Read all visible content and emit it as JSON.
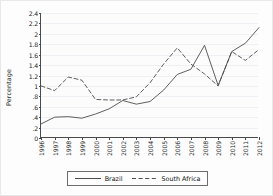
{
  "chart_data": {
    "type": "line",
    "title": "",
    "xlabel": "",
    "ylabel": "Percentage",
    "grid": true,
    "legend_position": "bottom",
    "x": [
      1996,
      1997,
      1998,
      1999,
      2000,
      2001,
      2002,
      2003,
      2004,
      2005,
      2006,
      2007,
      2008,
      2009,
      2010,
      2011,
      2012
    ],
    "xtick_labels": [
      "1996",
      "1997",
      "1998",
      "1999",
      "2000",
      "2001",
      "2002",
      "2003",
      "2004",
      "2005",
      "2006",
      "2007",
      "2008",
      "2009",
      "2010",
      "2011",
      "2012"
    ],
    "ytick_labels": [
      "0",
      ".2",
      ".4",
      ".6",
      ".8",
      "1",
      "1.2",
      "1.4",
      "1.6",
      "1.8",
      "2",
      "2.2",
      "2.4"
    ],
    "ytick_values": [
      0,
      0.2,
      0.4,
      0.6,
      0.8,
      1.0,
      1.2,
      1.4,
      1.6,
      1.8,
      2.0,
      2.2,
      2.4
    ],
    "ylim": [
      0,
      2.4
    ],
    "xlim": [
      1996,
      2012
    ],
    "series": [
      {
        "name": "Brazil",
        "style": "solid",
        "color": "#4d4d4d",
        "values": [
          0.27,
          0.4,
          0.41,
          0.38,
          0.46,
          0.56,
          0.72,
          0.65,
          0.7,
          0.92,
          1.22,
          1.32,
          1.78,
          1.01,
          1.66,
          1.82,
          2.12
        ]
      },
      {
        "name": "South Africa",
        "style": "dashed",
        "color": "#4d4d4d",
        "values": [
          1.0,
          0.91,
          1.17,
          1.11,
          0.74,
          0.73,
          0.73,
          0.79,
          1.06,
          1.42,
          1.73,
          1.42,
          1.23,
          1.0,
          1.66,
          1.49,
          1.7
        ]
      }
    ]
  },
  "legend": {
    "items": [
      {
        "label": "Brazil",
        "style": "solid"
      },
      {
        "label": "South Africa",
        "style": "dashed"
      }
    ]
  }
}
